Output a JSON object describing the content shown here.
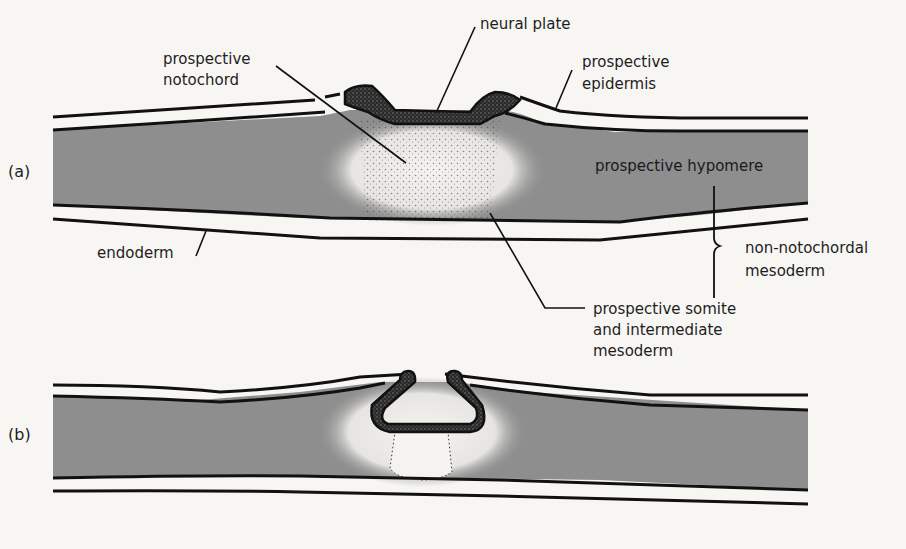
{
  "figure": {
    "panels": [
      {
        "id": "a",
        "label": "(a)"
      },
      {
        "id": "b",
        "label": "(b)"
      }
    ],
    "labels": {
      "neural_plate": "neural plate",
      "prospective_notochord_line1": "prospective",
      "prospective_notochord_line2": "notochord",
      "prospective_epidermis_line1": "prospective",
      "prospective_epidermis_line2": "epidermis",
      "prospective_hypomere": "prospective hypomere",
      "endoderm": "endoderm",
      "non_notochordal_line1": "non-notochordal",
      "non_notochordal_line2": "mesoderm",
      "somite_line1": "prospective somite",
      "somite_line2": "and intermediate",
      "somite_line3": "mesoderm"
    },
    "colors": {
      "mesoderm_fill": "#8e8e8e",
      "outline": "#111111",
      "neural_tissue": "#2a2a2a",
      "background": "#f7f6f3"
    }
  }
}
